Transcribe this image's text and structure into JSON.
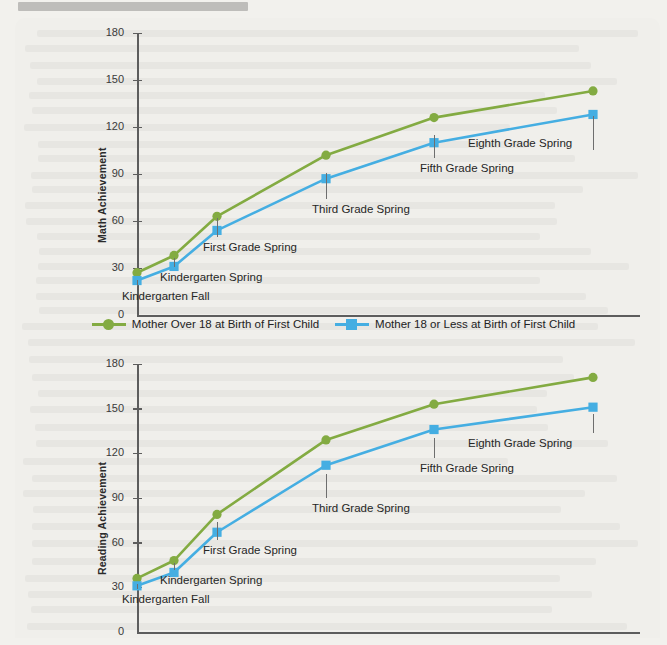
{
  "colors": {
    "green": "#83ab42",
    "blue": "#45aee2",
    "background": "#f2f1ed",
    "panel": "#f0efeb",
    "axis": "#5d5d5d",
    "text": "#262626"
  },
  "legend": {
    "items": [
      {
        "label": "Mother Over 18 at Birth of First Child",
        "marker": "circle",
        "color": "#83ab42"
      },
      {
        "label": "Mother 18 or Less at Birth of First Child",
        "marker": "square",
        "color": "#45aee2"
      }
    ]
  },
  "chart_data": [
    {
      "id": "math",
      "type": "line",
      "title": "",
      "ylabel": "Math Achievement",
      "xlabel": "",
      "categories": [
        "Kindergarten Fall",
        "Kindergarten Spring",
        "First Grade Spring",
        "Third Grade Spring",
        "Fifth Grade Spring",
        "Eighth Grade Spring"
      ],
      "yticks": [
        0,
        30,
        60,
        90,
        120,
        150,
        180
      ],
      "ylim": [
        0,
        180
      ],
      "grid": false,
      "legend_position": "bottom",
      "series": [
        {
          "name": "Mother Over 18 at Birth of First Child",
          "color": "#83ab42",
          "marker": "circle",
          "values": [
            27,
            38,
            63,
            102,
            126,
            143
          ]
        },
        {
          "name": "Mother 18 or Less at Birth of First Child",
          "color": "#45aee2",
          "marker": "square",
          "values": [
            22,
            31,
            54,
            87,
            110,
            128
          ]
        }
      ]
    },
    {
      "id": "reading",
      "type": "line",
      "title": "",
      "ylabel": "Reading Achievement",
      "xlabel": "",
      "categories": [
        "Kindergarten Fall",
        "Kindergarten Spring",
        "First Grade Spring",
        "Third Grade Spring",
        "Fifth Grade Spring",
        "Eighth Grade Spring"
      ],
      "yticks": [
        0,
        30,
        60,
        90,
        120,
        150,
        180
      ],
      "ylim": [
        0,
        180
      ],
      "grid": false,
      "legend_position": "none",
      "series": [
        {
          "name": "Mother Over 18 at Birth of First Child",
          "color": "#83ab42",
          "marker": "circle",
          "values": [
            36,
            48,
            79,
            129,
            153,
            171
          ]
        },
        {
          "name": "Mother 18 or Less at Birth of First Child",
          "color": "#45aee2",
          "marker": "square",
          "values": [
            31,
            40,
            67,
            112,
            136,
            151
          ]
        }
      ]
    }
  ]
}
